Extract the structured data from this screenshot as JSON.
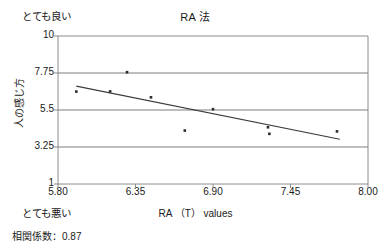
{
  "chart_data": {
    "type": "scatter",
    "title": "RA 法",
    "xlabel": "RA （T） values",
    "ylabel": "人の感じ方",
    "xlim": [
      5.8,
      8.0
    ],
    "ylim": [
      1,
      10
    ],
    "xticks": [
      "5.80",
      "6.35",
      "6.90",
      "7.45",
      "8.00"
    ],
    "xtick_values": [
      5.8,
      6.35,
      6.9,
      7.45,
      8.0
    ],
    "yticks": [
      "10",
      "7.75",
      "5.5",
      "3.25",
      "1"
    ],
    "ytick_values": [
      10,
      7.75,
      5.5,
      3.25,
      1
    ],
    "grid": "horizontal",
    "legend": "none",
    "points": [
      {
        "x": 5.93,
        "y": 6.62
      },
      {
        "x": 6.17,
        "y": 6.63
      },
      {
        "x": 6.29,
        "y": 7.8
      },
      {
        "x": 6.46,
        "y": 6.27
      },
      {
        "x": 6.7,
        "y": 4.25
      },
      {
        "x": 6.9,
        "y": 5.55
      },
      {
        "x": 7.29,
        "y": 4.45
      },
      {
        "x": 7.3,
        "y": 4.05
      },
      {
        "x": 7.78,
        "y": 4.2
      }
    ],
    "trendline": {
      "x_start": 5.93,
      "y_start": 6.95,
      "x_end": 7.8,
      "y_end": 3.72,
      "style": "solid"
    },
    "annotations": {
      "axis_top_label": "とても良い",
      "axis_bottom_label": "とても悪い",
      "correlation_note": "相関係数：0.87",
      "correlation_value": "0.87"
    },
    "colors": {
      "axis": "#808080",
      "gridline": "#6e6e6e",
      "point": "#2b2b2b",
      "trendline": "#3a3a3a",
      "background": "#ffffff"
    }
  }
}
